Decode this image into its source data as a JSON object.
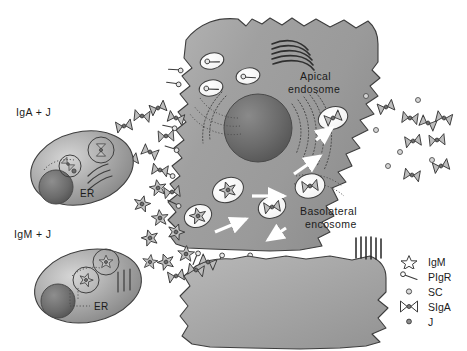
{
  "figure": {
    "title_absent": true,
    "background_color": "#ffffff",
    "cell_fill_light": "#c9c9c9",
    "cell_fill_mid": "#9d9d9d",
    "cell_fill_dark": "#6e6e6e",
    "nucleus_color": "#5f5f5f",
    "outline_color": "#3b3b3b",
    "arrow_color": "#ffffff"
  },
  "plasma_cells": [
    {
      "id": "iga-plasma-cell",
      "label": "IgA + J",
      "organelle_label": "ER",
      "contents": "IgA dimer with J chain"
    },
    {
      "id": "igm-plasma-cell",
      "label": "IgM + J",
      "organelle_label": "ER",
      "contents": "IgM pentamer with J chain"
    }
  ],
  "epithelial_cell": {
    "apical_label": "Apical\nendosome",
    "apical_label_line1": "Apical",
    "apical_label_line2": "endosome",
    "basolateral_label_line1": "Basolateral",
    "basolateral_label_line2": "encosome",
    "nucleus": "nucleus",
    "golgi": "golgi-stack",
    "microvilli": "microvilli"
  },
  "legend": {
    "items": [
      {
        "symbol": "star",
        "label": "IgM"
      },
      {
        "symbol": "hook",
        "label": "PIgR"
      },
      {
        "symbol": "small-circle",
        "label": "SC"
      },
      {
        "symbol": "bowtie",
        "label": "SIgA"
      },
      {
        "symbol": "dot",
        "label": "J"
      }
    ]
  },
  "icons": {
    "star": "igm-star-icon",
    "bowtie": "siga-bowtie-icon",
    "hook": "pigr-hook-icon",
    "dot": "j-chain-dot-icon",
    "small_circle": "sc-circle-icon",
    "arrow": "transport-arrow-icon"
  }
}
